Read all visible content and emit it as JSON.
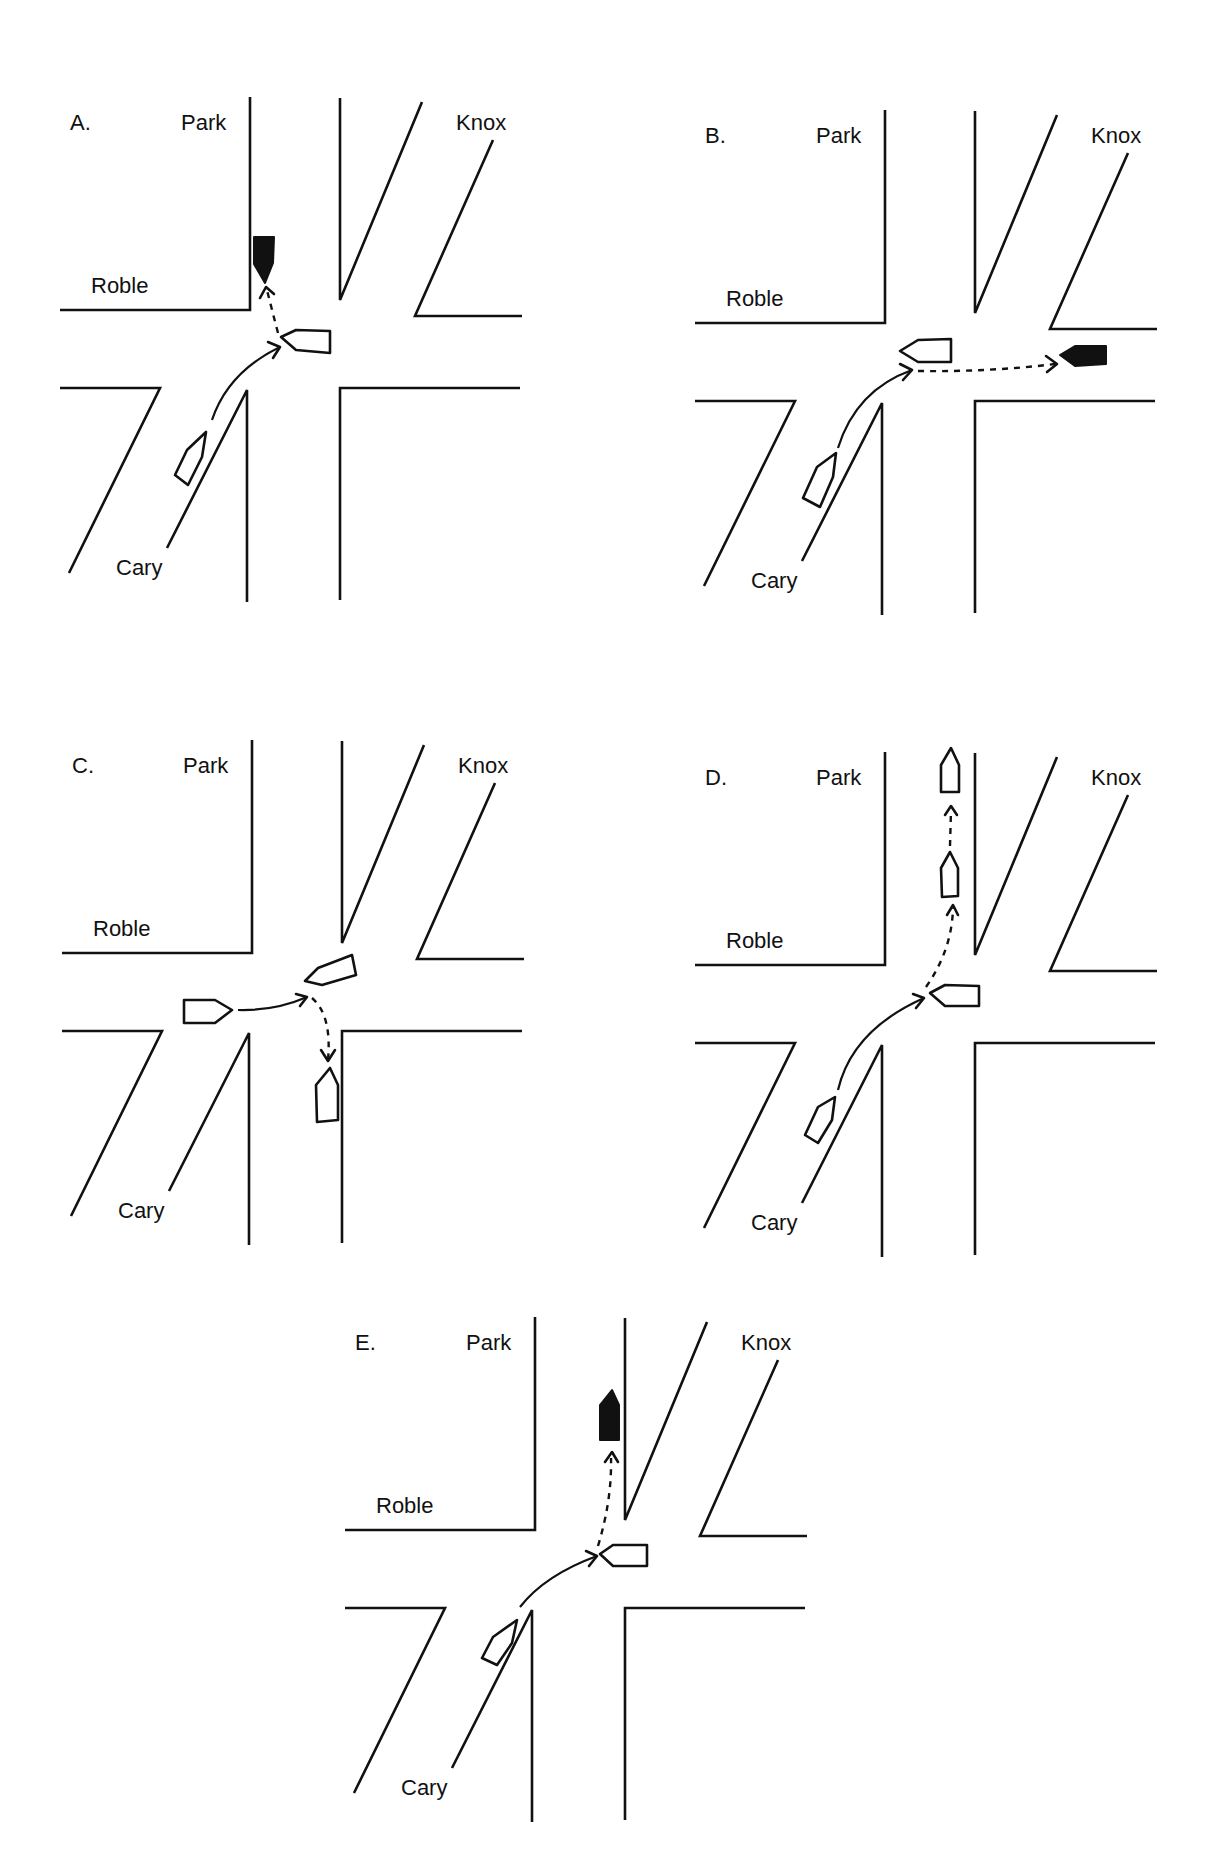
{
  "figure": {
    "background": "#ffffff",
    "ink": "#111111",
    "street_names": [
      "Park",
      "Knox",
      "Roble",
      "Cary"
    ]
  },
  "road_template": {
    "note_local_coords_panel_A": true,
    "lines": [
      [
        [
          250,
          97
        ],
        [
          250,
          310
        ],
        [
          60,
          310
        ]
      ],
      [
        [
          340,
          98
        ],
        [
          340,
          300
        ],
        [
          422,
          102
        ]
      ],
      [
        [
          493,
          140
        ],
        [
          415,
          316
        ],
        [
          522,
          316
        ]
      ],
      [
        [
          60,
          388
        ],
        [
          160,
          388
        ],
        [
          69,
          573
        ]
      ],
      [
        [
          167,
          548
        ],
        [
          247,
          390
        ],
        [
          247,
          602
        ]
      ],
      [
        [
          340,
          600
        ],
        [
          340,
          388
        ],
        [
          520,
          388
        ]
      ]
    ],
    "labels": [
      {
        "key": "panel",
        "x": 70,
        "y": 130
      },
      {
        "key": "park",
        "x": 181,
        "y": 130
      },
      {
        "key": "knox",
        "x": 456,
        "y": 130
      },
      {
        "key": "roble",
        "x": 91,
        "y": 293
      },
      {
        "key": "cary",
        "x": 116,
        "y": 575
      }
    ]
  },
  "panels": [
    {
      "id": "A",
      "label": "A.",
      "offset": [
        0,
        0
      ],
      "street_labels": {
        "park": "Park",
        "knox": "Knox",
        "roble": "Roble",
        "cary": "Cary"
      },
      "cars": [
        {
          "name": "cary-car",
          "fill": "white",
          "points": [
            [
              175,
              475
            ],
            [
              187,
              450
            ],
            [
              206,
              432
            ],
            [
              202,
              457
            ],
            [
              188,
              485
            ]
          ]
        },
        {
          "name": "roble-east-car",
          "fill": "white",
          "points": [
            [
              281,
              337
            ],
            [
              296,
              330
            ],
            [
              330,
              331
            ],
            [
              330,
              353
            ],
            [
              296,
              350
            ]
          ]
        },
        {
          "name": "park-car",
          "fill": "black",
          "points": [
            [
              254,
              237
            ],
            [
              274,
              237
            ],
            [
              273,
              263
            ],
            [
              265,
              283
            ],
            [
              254,
              264
            ]
          ]
        }
      ],
      "paths": [
        {
          "style": "solid",
          "d": "M212,420 Q228,372 280,347",
          "arrow": [
            [
              268,
              342
            ],
            [
              280,
              347
            ],
            [
              273,
              358
            ]
          ]
        },
        {
          "style": "dashed",
          "d": "M278,333 Q272,310 267,290",
          "arrow": [
            [
              260,
              298
            ],
            [
              266,
              287
            ],
            [
              274,
              294
            ]
          ]
        }
      ]
    },
    {
      "id": "B",
      "label": "B.",
      "offset": [
        635,
        13
      ],
      "street_labels": {
        "park": "Park",
        "knox": "Knox",
        "roble": "Roble",
        "cary": "Cary"
      },
      "cars": [
        {
          "name": "cary-car",
          "fill": "white",
          "points": [
            [
              803,
              498
            ],
            [
              817,
              467
            ],
            [
              836,
              453
            ],
            [
              833,
              477
            ],
            [
              820,
              507
            ]
          ]
        },
        {
          "name": "roble-east-car",
          "fill": "white",
          "points": [
            [
              900,
              351
            ],
            [
              918,
              340
            ],
            [
              951,
              339
            ],
            [
              951,
              362
            ],
            [
              918,
              362
            ]
          ]
        },
        {
          "name": "knox-car",
          "fill": "black",
          "points": [
            [
              1060,
              355
            ],
            [
              1075,
              346
            ],
            [
              1106,
              346
            ],
            [
              1106,
              364
            ],
            [
              1075,
              366
            ]
          ]
        }
      ],
      "paths": [
        {
          "style": "solid",
          "d": "M838,448 Q856,390 912,370",
          "arrow": [
            [
              900,
              364
            ],
            [
              912,
              370
            ],
            [
              903,
              380
            ]
          ]
        },
        {
          "style": "dashed",
          "d": "M918,371 Q990,372 1055,364",
          "arrow": [
            [
              1046,
              356
            ],
            [
              1057,
              364
            ],
            [
              1047,
              372
            ]
          ]
        }
      ]
    },
    {
      "id": "C",
      "label": "C.",
      "offset": [
        2,
        643
      ],
      "street_labels": {
        "park": "Park",
        "knox": "Knox",
        "roble": "Roble",
        "cary": "Cary"
      },
      "cars": [
        {
          "name": "roble-west-car",
          "fill": "white",
          "points": [
            [
              184,
              1000
            ],
            [
              215,
              1000
            ],
            [
              232,
              1010
            ],
            [
              215,
              1023
            ],
            [
              184,
              1023
            ]
          ]
        },
        {
          "name": "roble-east-car",
          "fill": "white",
          "points": [
            [
              305,
              981
            ],
            [
              318,
              968
            ],
            [
              352,
              955
            ],
            [
              356,
              975
            ],
            [
              322,
              985
            ]
          ]
        },
        {
          "name": "cary-south-car",
          "fill": "white",
          "points": [
            [
              316,
              1085
            ],
            [
              330,
              1068
            ],
            [
              338,
              1085
            ],
            [
              338,
              1120
            ],
            [
              317,
              1122
            ]
          ]
        }
      ],
      "paths": [
        {
          "style": "solid",
          "d": "M238,1010 Q275,1011 307,997",
          "arrow": [
            [
              296,
              994
            ],
            [
              307,
              997
            ],
            [
              300,
              1006
            ]
          ]
        },
        {
          "style": "dashed",
          "d": "M312,998 Q332,1015 328,1060",
          "arrow": [
            [
              321,
              1050
            ],
            [
              328,
              1061
            ],
            [
              335,
              1050
            ]
          ]
        }
      ]
    },
    {
      "id": "D",
      "label": "D.",
      "offset": [
        635,
        655
      ],
      "street_labels": {
        "park": "Park",
        "knox": "Knox",
        "roble": "Roble",
        "cary": "Cary"
      },
      "cars": [
        {
          "name": "cary-car",
          "fill": "white",
          "points": [
            [
              805,
              1135
            ],
            [
              818,
              1107
            ],
            [
              835,
              1097
            ],
            [
              832,
              1120
            ],
            [
              818,
              1143
            ]
          ]
        },
        {
          "name": "roble-east-car",
          "fill": "white",
          "points": [
            [
              930,
              993
            ],
            [
              945,
              985
            ],
            [
              979,
              986
            ],
            [
              979,
              1006
            ],
            [
              945,
              1006
            ]
          ]
        },
        {
          "name": "park-mid-car",
          "fill": "white",
          "points": [
            [
              941,
              868
            ],
            [
              950,
              852
            ],
            [
              958,
              868
            ],
            [
              958,
              896
            ],
            [
              942,
              897
            ]
          ]
        },
        {
          "name": "park-top-car",
          "fill": "white",
          "points": [
            [
              941,
              765
            ],
            [
              951,
              748
            ],
            [
              959,
              765
            ],
            [
              959,
              792
            ],
            [
              941,
              792
            ]
          ]
        }
      ],
      "paths": [
        {
          "style": "solid",
          "d": "M838,1090 Q852,1030 924,998",
          "arrow": [
            [
              913,
              994
            ],
            [
              924,
              998
            ],
            [
              916,
              1008
            ]
          ]
        },
        {
          "style": "dashed",
          "d": "M926,987 Q952,950 953,908",
          "arrow": [
            [
              947,
              915
            ],
            [
              953,
              905
            ],
            [
              958,
              915
            ]
          ]
        },
        {
          "style": "dashed",
          "d": "M950,846 L951,810",
          "arrow": [
            [
              945,
              815
            ],
            [
              951,
              806
            ],
            [
              957,
              815
            ]
          ]
        }
      ]
    },
    {
      "id": "E",
      "label": "E.",
      "offset": [
        285,
        1220
      ],
      "street_labels": {
        "park": "Park",
        "knox": "Knox",
        "roble": "Roble",
        "cary": "Cary"
      },
      "cars": [
        {
          "name": "cary-car",
          "fill": "white",
          "points": [
            [
              482,
              1658
            ],
            [
              493,
              1637
            ],
            [
              517,
              1620
            ],
            [
              512,
              1643
            ],
            [
              497,
              1665
            ]
          ]
        },
        {
          "name": "roble-east-car",
          "fill": "white",
          "points": [
            [
              600,
              1554
            ],
            [
              613,
              1545
            ],
            [
              647,
              1545
            ],
            [
              647,
              1566
            ],
            [
              613,
              1566
            ]
          ]
        },
        {
          "name": "park-car",
          "fill": "black",
          "points": [
            [
              600,
              1440
            ],
            [
              600,
              1405
            ],
            [
              612,
              1390
            ],
            [
              619,
              1405
            ],
            [
              619,
              1440
            ]
          ]
        }
      ],
      "paths": [
        {
          "style": "solid",
          "d": "M520,1607 Q545,1575 597,1556",
          "arrow": [
            [
              586,
              1551
            ],
            [
              597,
              1556
            ],
            [
              589,
              1566
            ]
          ]
        },
        {
          "style": "dashed",
          "d": "M598,1546 Q612,1500 611,1458",
          "arrow": [
            [
              605,
              1462
            ],
            [
              612,
              1452
            ],
            [
              618,
              1462
            ]
          ]
        }
      ]
    }
  ]
}
